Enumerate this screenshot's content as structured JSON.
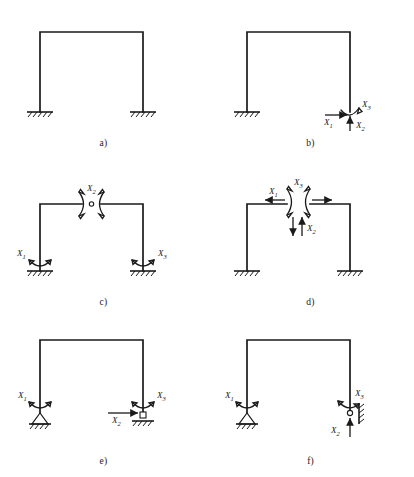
{
  "figure": {
    "panel_count": 6,
    "geometry": {
      "frame_left_x": 40,
      "frame_right_x": 143,
      "beam_y": 32,
      "base_y": 112,
      "support_half_width": 13
    }
  },
  "labels": {
    "x1": "X",
    "x2": "X",
    "x3": "X",
    "sub1": "1",
    "sub2": "2",
    "sub3": "3"
  },
  "panels": [
    {
      "id": "panel-a",
      "caption": "a)",
      "description": "Portal frame with two fixed base supports, no releases",
      "supports": [
        {
          "name": "fixed-support-left",
          "type": "fixed",
          "x": 40
        },
        {
          "name": "fixed-support-right",
          "type": "fixed",
          "x": 143
        }
      ],
      "releases": []
    },
    {
      "id": "panel-b",
      "caption": "b)",
      "description": "Right base released as free end with three redundants",
      "supports": [
        {
          "name": "fixed-support-left",
          "type": "fixed",
          "x": 40
        }
      ],
      "releases": [
        {
          "name": "redundant-x1",
          "label": "X1",
          "kind": "force-horizontal",
          "direction": "right"
        },
        {
          "name": "redundant-x2",
          "label": "X2",
          "kind": "force-vertical",
          "direction": "up"
        },
        {
          "name": "redundant-x3",
          "label": "X3",
          "kind": "moment",
          "direction": "arc"
        }
      ]
    },
    {
      "id": "panel-c",
      "caption": "c)",
      "description": "Three moment releases: both fixed bases plus a mid-span beam hinge",
      "supports": [
        {
          "name": "fixed-support-left",
          "type": "fixed",
          "x": 40
        },
        {
          "name": "fixed-support-right",
          "type": "fixed",
          "x": 143
        }
      ],
      "releases": [
        {
          "name": "redundant-x1",
          "label": "X1",
          "kind": "moment",
          "location": "left-base"
        },
        {
          "name": "redundant-x2",
          "label": "X2",
          "kind": "moment-hinge",
          "location": "beam-midspan"
        },
        {
          "name": "redundant-x3",
          "label": "X3",
          "kind": "moment",
          "location": "right-base"
        }
      ]
    },
    {
      "id": "panel-d",
      "caption": "d)",
      "description": "Beam cut at mid-span exposing three conjugate redundant pairs",
      "supports": [
        {
          "name": "fixed-support-left",
          "type": "fixed",
          "x": 40
        },
        {
          "name": "fixed-support-right",
          "type": "fixed",
          "x": 143
        }
      ],
      "releases": [
        {
          "name": "redundant-x1",
          "label": "X1",
          "kind": "force-pair-horizontal"
        },
        {
          "name": "redundant-x2",
          "label": "X2",
          "kind": "force-pair-vertical"
        },
        {
          "name": "redundant-x3",
          "label": "X3",
          "kind": "moment-pair"
        }
      ]
    },
    {
      "id": "panel-e",
      "caption": "e)",
      "description": "Left pinned support and right sliding support with moment releases",
      "supports": [
        {
          "name": "pinned-support-left",
          "type": "pinned",
          "x": 40
        },
        {
          "name": "roller-support-right",
          "type": "roller",
          "x": 143
        }
      ],
      "releases": [
        {
          "name": "redundant-x1",
          "label": "X1",
          "kind": "moment",
          "location": "left-base"
        },
        {
          "name": "redundant-x2",
          "label": "X2",
          "kind": "force-horizontal",
          "direction": "right"
        },
        {
          "name": "redundant-x3",
          "label": "X3",
          "kind": "moment",
          "location": "right-base"
        }
      ]
    },
    {
      "id": "panel-f",
      "caption": "f)",
      "description": "Left pinned support and right vertical wall support with releases",
      "supports": [
        {
          "name": "pinned-support-left",
          "type": "pinned",
          "x": 40
        },
        {
          "name": "wall-support-right",
          "type": "vertical-wall",
          "x": 143
        }
      ],
      "releases": [
        {
          "name": "redundant-x1",
          "label": "X1",
          "kind": "moment",
          "location": "left-base"
        },
        {
          "name": "redundant-x2",
          "label": "X2",
          "kind": "force-vertical",
          "direction": "up"
        },
        {
          "name": "redundant-x3",
          "label": "X3",
          "kind": "moment",
          "location": "right-base"
        }
      ]
    }
  ]
}
